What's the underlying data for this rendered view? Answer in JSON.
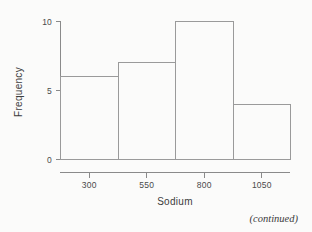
{
  "page": {
    "background_color": "#fbfbfa",
    "footer_note": "(continued)"
  },
  "chart_data": {
    "type": "bar",
    "subtype": "histogram",
    "title": "",
    "xlabel": "Sodium",
    "ylabel": "Frequency",
    "categories": [
      "175-425",
      "425-675",
      "675-925",
      "925-1175"
    ],
    "bin_edges": [
      175,
      425,
      675,
      925,
      1175
    ],
    "values": [
      6,
      7,
      10,
      4
    ],
    "x_tick_labels": [
      "300",
      "550",
      "800",
      "1050"
    ],
    "x_tick_values": [
      300,
      550,
      800,
      1050
    ],
    "y_tick_labels": [
      "0",
      "5",
      "10"
    ],
    "y_tick_values": [
      0,
      5,
      10
    ],
    "xlim": [
      175,
      1175
    ],
    "ylim": [
      0,
      10
    ],
    "grid": false,
    "legend": false,
    "bar_fill": "none",
    "bar_stroke": "#9a9a9a",
    "axis_color": "#8a8a8a"
  },
  "axes": {
    "x_title": "Sodium",
    "y_title": "Frequency"
  }
}
